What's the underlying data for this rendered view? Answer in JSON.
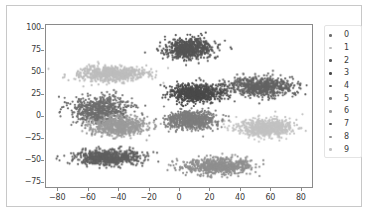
{
  "figure": {
    "background_color": "#ffffff",
    "frame_color": "#c8c8c8",
    "axes_edge_color": "#8a8a8a"
  },
  "chart_data": {
    "type": "scatter",
    "title": "",
    "xlabel": "",
    "ylabel": "",
    "xlim": [
      -88,
      88
    ],
    "ylim": [
      -82,
      104
    ],
    "grid": false,
    "legend_position": "right",
    "legend_title": "",
    "marker_size": 2.2,
    "xticks": [
      -80,
      -60,
      -40,
      -20,
      0,
      20,
      40,
      60,
      80
    ],
    "xtick_labels": [
      "−80",
      "−60",
      "−40",
      "−20",
      "0",
      "20",
      "40",
      "60",
      "80"
    ],
    "yticks": [
      -75,
      -50,
      -25,
      0,
      25,
      50,
      75,
      100
    ],
    "ytick_labels": [
      "−75",
      "−50",
      "−25",
      "0",
      "25",
      "50",
      "75",
      "100"
    ],
    "series": [
      {
        "name": "0",
        "color": "#6e6e6e",
        "n_points": 680,
        "center": [
          -52,
          6
        ],
        "spread": [
          15,
          13
        ],
        "description": "mid-gray cluster on the left at roughly x -70..-32, y -10..22"
      },
      {
        "name": "1",
        "color": "#bdbdbd",
        "n_points": 700,
        "center": [
          -44,
          48
        ],
        "spread": [
          18,
          7
        ],
        "description": "light gray elongated cluster upper-left, x -68..-18, y 38..60"
      },
      {
        "name": "2",
        "color": "#555555",
        "n_points": 690,
        "center": [
          7,
          77
        ],
        "spread": [
          12,
          9
        ],
        "description": "dark cluster top-center, x -8..22, y 60..95"
      },
      {
        "name": "3",
        "color": "#4a4a4a",
        "n_points": 700,
        "center": [
          12,
          26
        ],
        "spread": [
          14,
          8
        ],
        "description": "dark cluster center, x -8..32, y 12..40"
      },
      {
        "name": "4",
        "color": "#636363",
        "n_points": 700,
        "center": [
          55,
          33
        ],
        "spread": [
          17,
          9
        ],
        "description": "medium-dark cluster upper-right, x 30..80, y 18..48"
      },
      {
        "name": "5",
        "color": "#7d7d7d",
        "n_points": 700,
        "center": [
          8,
          -5
        ],
        "spread": [
          13,
          8
        ],
        "description": "gray cluster center, x -8..26, y -18..8"
      },
      {
        "name": "6",
        "color": "#9b9b9b",
        "n_points": 690,
        "center": [
          -40,
          -12
        ],
        "spread": [
          14,
          9
        ],
        "description": "light-mid gray cluster left-lower, x -62..-16, y -26..4"
      },
      {
        "name": "7",
        "color": "#5f5f5f",
        "n_points": 700,
        "center": [
          -46,
          -48
        ],
        "spread": [
          17,
          7
        ],
        "description": "dark-gray elongated cluster bottom-left, x -72..-18, y -58..-38"
      },
      {
        "name": "8",
        "color": "#8f8f8f",
        "n_points": 700,
        "center": [
          25,
          -58
        ],
        "spread": [
          18,
          7
        ],
        "description": "gray elongated cluster bottom-center-right, x 2..58, y -70..-44"
      },
      {
        "name": "9",
        "color": "#c2c2c2",
        "n_points": 700,
        "center": [
          58,
          -14
        ],
        "spread": [
          14,
          8
        ],
        "description": "light gray cluster right, x 36..80, y -28..0"
      }
    ]
  },
  "legend": {
    "items": [
      {
        "label": "0",
        "color": "#6e6e6e"
      },
      {
        "label": "1",
        "color": "#bdbdbd"
      },
      {
        "label": "2",
        "color": "#555555"
      },
      {
        "label": "3",
        "color": "#4a4a4a"
      },
      {
        "label": "4",
        "color": "#636363"
      },
      {
        "label": "5",
        "color": "#7d7d7d"
      },
      {
        "label": "6",
        "color": "#9b9b9b"
      },
      {
        "label": "7",
        "color": "#5f5f5f"
      },
      {
        "label": "8",
        "color": "#8f8f8f"
      },
      {
        "label": "9",
        "color": "#c2c2c2"
      }
    ]
  }
}
